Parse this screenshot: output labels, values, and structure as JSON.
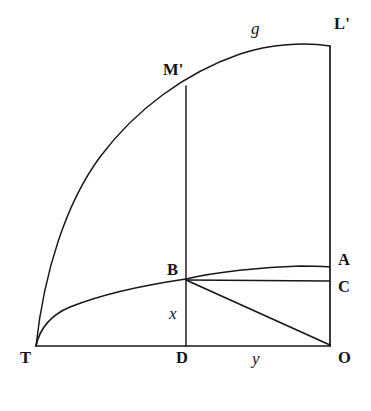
{
  "figure": {
    "background_color": "#ffffff",
    "ink_color": "#17161a",
    "width": 371,
    "height": 411
  },
  "labels": [
    {
      "id": "L-prime",
      "text": "L'",
      "style": "roman",
      "x": 334,
      "y": 16,
      "name": "label-l-prime"
    },
    {
      "id": "g",
      "text": "g",
      "style": "italic",
      "x": 251,
      "y": 20,
      "name": "label-g"
    },
    {
      "id": "M-prime",
      "text": "M'",
      "style": "roman",
      "x": 163,
      "y": 62,
      "name": "label-m-prime"
    },
    {
      "id": "A",
      "text": "A",
      "style": "roman",
      "x": 338,
      "y": 252,
      "name": "label-a"
    },
    {
      "id": "B",
      "text": "B",
      "style": "roman",
      "x": 167,
      "y": 262,
      "name": "label-b"
    },
    {
      "id": "C",
      "text": "C",
      "style": "roman",
      "x": 338,
      "y": 279,
      "name": "label-c"
    },
    {
      "id": "x",
      "text": "x",
      "style": "italic",
      "x": 169,
      "y": 305,
      "name": "label-x"
    },
    {
      "id": "T",
      "text": "T",
      "style": "roman",
      "x": 20,
      "y": 350,
      "name": "label-t"
    },
    {
      "id": "D",
      "text": "D",
      "style": "roman",
      "x": 176,
      "y": 350,
      "name": "label-d"
    },
    {
      "id": "y",
      "text": "y",
      "style": "italic",
      "x": 252,
      "y": 350,
      "name": "label-y"
    },
    {
      "id": "O",
      "text": "O",
      "style": "roman",
      "x": 338,
      "y": 350,
      "name": "label-o"
    }
  ],
  "points": {
    "T": {
      "x": 36,
      "y": 346
    },
    "D": {
      "x": 186,
      "y": 346
    },
    "O": {
      "x": 330,
      "y": 346
    },
    "B": {
      "x": 186,
      "y": 279
    },
    "C": {
      "x": 330,
      "y": 281
    },
    "A": {
      "x": 330,
      "y": 267
    },
    "Mp": {
      "x": 186,
      "y": 86
    },
    "Lp": {
      "x": 330,
      "y": 46
    }
  },
  "paths": {
    "baseline_T_O": "M 36 346 L 330 346",
    "right_vertical_O_Lp": "M 330 346 L 330 46",
    "mid_vertical_D_Mp": "M 186 346 L 186 86",
    "top_curve_T_Lp": "M 36 346 C 44 272 66 203 100 157 C 135 110 185 73 240 54 C 270 44 305 42 330 46",
    "lower_curve_T_B": "M 36 346 C 40 327 51 315 70 307 C 100 295 145 285 186 279",
    "curve_B_A": "M 186 279 C 215 272 262 267 300 266 C 312 266 323 266 330 267",
    "segment_B_C": "M 186 280 L 330 281",
    "segment_B_O": "M 186 280 L 330 345"
  }
}
